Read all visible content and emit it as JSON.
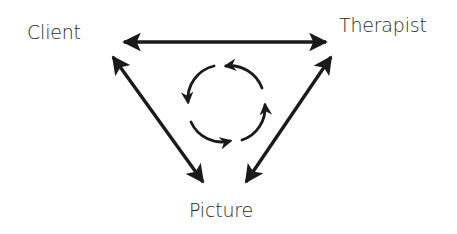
{
  "diagram": {
    "type": "triangular relationship diagram",
    "nodes": [
      {
        "id": "client",
        "label": "Client"
      },
      {
        "id": "therapist",
        "label": "Therapist"
      },
      {
        "id": "picture",
        "label": "Picture"
      }
    ],
    "edges": [
      {
        "from": "client",
        "to": "therapist",
        "direction": "bidirectional"
      },
      {
        "from": "client",
        "to": "picture",
        "direction": "bidirectional"
      },
      {
        "from": "therapist",
        "to": "picture",
        "direction": "bidirectional"
      }
    ],
    "center_symbol": {
      "type": "cycle",
      "arrow_count": 4,
      "direction": "counterclockwise"
    },
    "colors": {
      "line": "#1a1a1a",
      "text": "#2a2a2a",
      "background": "#ffffff"
    }
  }
}
